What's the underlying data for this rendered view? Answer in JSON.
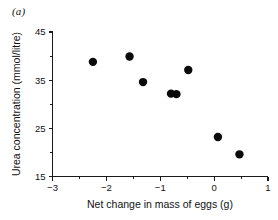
{
  "figure": {
    "panel_label": "(a)",
    "background_color": "#ffffff",
    "marker_color": "#0b0b0b",
    "axis_color": "#1a1a1a"
  },
  "chart_data": {
    "type": "scatter",
    "title": "",
    "subtitle": "",
    "xlabel": "Net change in mass of eggs (g)",
    "ylabel": "Urea concentration (mmol/litre)",
    "xlim": [
      -3,
      1
    ],
    "ylim": [
      15,
      45
    ],
    "xticks": [
      -3,
      -2,
      -1,
      0,
      1
    ],
    "xtick_labels": [
      "−3",
      "−2",
      "−1",
      "0",
      "1"
    ],
    "yticks": [
      15,
      25,
      35,
      45
    ],
    "ytick_labels": [
      "15",
      "25",
      "35",
      "45"
    ],
    "y_minor_ticks": [
      20,
      30,
      40
    ],
    "x_minor_ticks": [
      -2.5,
      -1.5,
      -0.5,
      0.5
    ],
    "grid": false,
    "legend": null,
    "marker": "filled-circle",
    "marker_size_px": 4.2,
    "points": [
      {
        "x": -2.25,
        "y": 38.8
      },
      {
        "x": -1.57,
        "y": 39.9
      },
      {
        "x": -1.32,
        "y": 34.6
      },
      {
        "x": -0.8,
        "y": 32.2
      },
      {
        "x": -0.7,
        "y": 32.1
      },
      {
        "x": -0.48,
        "y": 37.1
      },
      {
        "x": 0.07,
        "y": 23.2
      },
      {
        "x": 0.47,
        "y": 19.6
      }
    ],
    "annotations": [
      "(a)"
    ]
  }
}
